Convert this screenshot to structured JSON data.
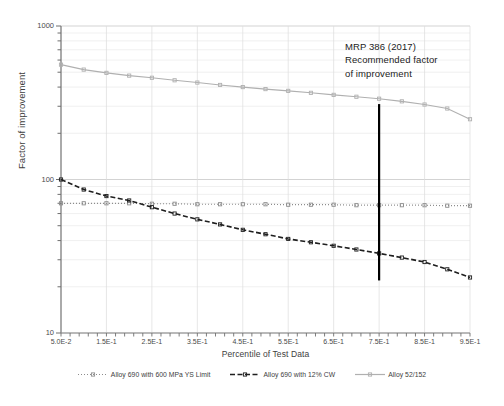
{
  "chart_data": {
    "type": "line",
    "title": "",
    "xlabel": "Percentile of Test Data",
    "ylabel": "Factor of improvement",
    "yscale": "log",
    "ylim": [
      10,
      1000
    ],
    "xlim": [
      0.05,
      0.95
    ],
    "grid": true,
    "legend_position": "bottom",
    "ytick_labels": [
      "1000",
      "100",
      "10"
    ],
    "ytick_values": [
      1000,
      100,
      10
    ],
    "xtick_labels": [
      "5.0E-2",
      "1.5E-1",
      "2.5E-1",
      "3.5E-1",
      "4.5E-1",
      "5.5E-1",
      "6.5E-1",
      "7.5E-1",
      "8.5E-1",
      "9.5E-1"
    ],
    "xtick_values": [
      0.05,
      0.15,
      0.25,
      0.35,
      0.45,
      0.55,
      0.65,
      0.75,
      0.85,
      0.95
    ],
    "x": [
      0.05,
      0.1,
      0.15,
      0.2,
      0.25,
      0.3,
      0.35,
      0.4,
      0.45,
      0.5,
      0.55,
      0.6,
      0.65,
      0.7,
      0.75,
      0.8,
      0.85,
      0.9,
      0.95
    ],
    "series": [
      {
        "name": "Alloy 690 with 600 MPa YS Limit",
        "color": "#8c8c8c",
        "style": "dotted",
        "marker": "square",
        "values": [
          70,
          70,
          70,
          70,
          69.5,
          69.5,
          69,
          69,
          69,
          69,
          68.5,
          68.5,
          68.5,
          68,
          68,
          68,
          68,
          67.5,
          67.5
        ]
      },
      {
        "name": "Alloy 690 with 12% CW",
        "color": "#1f1f1f",
        "style": "dashed",
        "marker": "square",
        "values": [
          100,
          86,
          78,
          73,
          66,
          60,
          55,
          51,
          47,
          44,
          41,
          39,
          37,
          35,
          33,
          31,
          29,
          26,
          23
        ]
      },
      {
        "name": "Alloy 52/152",
        "color": "#b0b0b0",
        "style": "solid",
        "marker": "square",
        "values": [
          560,
          520,
          495,
          475,
          460,
          443,
          428,
          413,
          400,
          388,
          378,
          367,
          356,
          346,
          336,
          323,
          308,
          290,
          247
        ]
      }
    ],
    "annotations": [
      {
        "text_lines": [
          "MRP 386 (2017)",
          "Recommended factor",
          "of improvement"
        ],
        "marker_line_x": 0.75,
        "marker_line_y_range": [
          22,
          310
        ],
        "marker_line_color": "#000000"
      }
    ]
  },
  "annotation": {
    "line1": "MRP 386 (2017)",
    "line2": "Recommended factor",
    "line3": "of improvement"
  },
  "axes": {
    "y_title": "Factor of improvement",
    "x_title": "Percentile of Test Data"
  }
}
